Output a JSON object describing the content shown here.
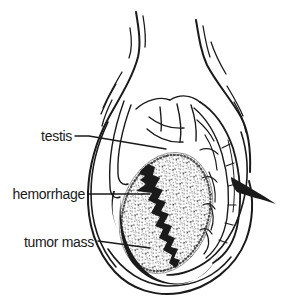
{
  "figure": {
    "background": "#ffffff",
    "ink": "#1a1a1a",
    "labels": {
      "testis": "testis",
      "hemorrhage": "hemorrhage",
      "tumor_mass": "tumor mass"
    }
  }
}
